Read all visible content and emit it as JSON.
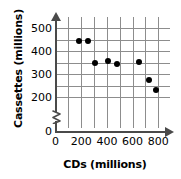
{
  "chart_data": {
    "type": "scatter",
    "title": "",
    "xlabel": "CDs (millions)",
    "ylabel": "Cassettes (millions)",
    "xlim": [
      0,
      900
    ],
    "ylim": [
      150,
      530
    ],
    "grid": true,
    "legend": null,
    "axis_break_y": true,
    "xticks": [
      0,
      200,
      400,
      600,
      800
    ],
    "yticks": [
      0,
      200,
      300,
      400,
      500
    ],
    "xtick_labels": [
      "0",
      "200",
      "400",
      "600",
      "800"
    ],
    "ytick_labels": [
      "0",
      "200",
      "300",
      "400",
      "500"
    ],
    "x": [
      180,
      255,
      310,
      405,
      475,
      650,
      730,
      780
    ],
    "y": [
      445,
      442,
      350,
      357,
      343,
      352,
      275,
      232
    ],
    "points": [
      {
        "x": 180,
        "y": 445
      },
      {
        "x": 255,
        "y": 442
      },
      {
        "x": 310,
        "y": 350
      },
      {
        "x": 405,
        "y": 357
      },
      {
        "x": 475,
        "y": 343
      },
      {
        "x": 650,
        "y": 352
      },
      {
        "x": 730,
        "y": 275
      },
      {
        "x": 780,
        "y": 232
      }
    ],
    "marker": "filled-circle",
    "marker_color": "#000000",
    "grid_color": "#8d8d8d",
    "axis_color": "#4a4a4a"
  },
  "axes": {
    "y_title": "Cassettes (millions)",
    "x_title": "CDs (millions)",
    "y_origin_label": "0",
    "x_origin_label": "0"
  }
}
